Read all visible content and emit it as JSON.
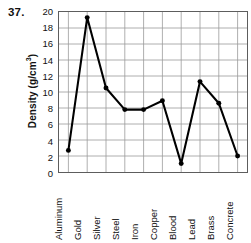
{
  "problem": {
    "number": "37."
  },
  "chart_data": {
    "type": "line",
    "title": "",
    "xlabel": "",
    "ylabel": "Density (g/cm",
    "ylabel_sup": "3",
    "ylabel_suffix": ")",
    "ylabel_full": "Density (g/cm3)",
    "categories": [
      "Aluminum",
      "Gold",
      "Silver",
      "Steel",
      "Iron",
      "Copper",
      "Blood",
      "Lead",
      "Brass",
      "Concrete"
    ],
    "values": [
      2.7,
      19.3,
      10.5,
      7.8,
      7.8,
      8.9,
      1.05,
      11.3,
      8.6,
      2.0
    ],
    "series": [
      {
        "name": "Density",
        "values": [
          2.7,
          19.3,
          10.5,
          7.8,
          7.8,
          8.9,
          1.05,
          11.3,
          8.6,
          2.0
        ]
      }
    ],
    "ylim": [
      0,
      20
    ],
    "ytick_step": 2,
    "yticks": [
      "20",
      "18",
      "16",
      "14",
      "12",
      "10",
      "8",
      "6",
      "4",
      "2",
      "0"
    ],
    "ytick_values": [
      20,
      18,
      16,
      14,
      12,
      10,
      8,
      6,
      4,
      2,
      0
    ],
    "grid": "both",
    "legend": "none",
    "marker": "circle",
    "line_color": "#000000",
    "marker_color": "#000000",
    "grid_color": "#9a9a9a",
    "frame_color": "#5d5d5d"
  }
}
